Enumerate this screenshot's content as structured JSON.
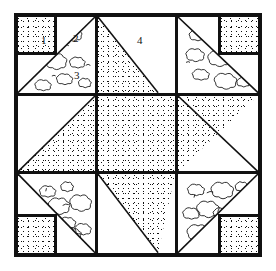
{
  "figure": {
    "kind": "quilt-block-diagram",
    "title": "",
    "background": "#ffffff",
    "line_color": "#111111",
    "frame": {
      "x": 14,
      "y": 13,
      "width": 248,
      "height": 244,
      "border_width": 4
    },
    "grid": {
      "rows": 3,
      "cols": 3,
      "divider_width": 3
    }
  },
  "labels": [
    {
      "id": "1",
      "text": "1",
      "patch": "corner-square-dotted",
      "cell": "top-left",
      "x": 41,
      "y": 35
    },
    {
      "id": "2",
      "text": "2",
      "patch": "white-background",
      "cell": "top-left",
      "x": 73,
      "y": 33
    },
    {
      "id": "3",
      "text": "3",
      "patch": "floral-triangle",
      "cell": "top-left",
      "x": 74,
      "y": 70
    },
    {
      "id": "4",
      "text": "4",
      "patch": "white-background",
      "cell": "top-middle",
      "x": 137,
      "y": 35
    }
  ],
  "fabrics": [
    {
      "name": "dotted",
      "description": "small dark speckles on white"
    },
    {
      "name": "floral",
      "description": "cloud-like flower motifs outlined on white"
    },
    {
      "name": "plain",
      "description": "solid white background"
    }
  ],
  "cells": [
    {
      "position": "top-left",
      "row": 1,
      "col": 1,
      "patches": [
        "dotted-square-top-left",
        "plain",
        "floral-triangle-lower-right"
      ]
    },
    {
      "position": "top-middle",
      "row": 1,
      "col": 2,
      "patches": [
        "dotted-triangle-left",
        "plain"
      ]
    },
    {
      "position": "top-right",
      "row": 1,
      "col": 3,
      "patches": [
        "dotted-square-top-right",
        "plain",
        "floral-triangle-lower-left"
      ]
    },
    {
      "position": "middle-left",
      "row": 2,
      "col": 1,
      "patches": [
        "plain-triangle-upper",
        "dotted-triangle-lower"
      ]
    },
    {
      "position": "center",
      "row": 2,
      "col": 2,
      "patches": [
        "dotted-square-full"
      ]
    },
    {
      "position": "middle-right",
      "row": 2,
      "col": 3,
      "patches": [
        "dotted-triangle-upper",
        "plain-triangle-lower"
      ]
    },
    {
      "position": "bottom-left",
      "row": 3,
      "col": 1,
      "patches": [
        "floral-triangle-upper-right",
        "plain",
        "dotted-square-bottom-left"
      ]
    },
    {
      "position": "bottom-middle",
      "row": 3,
      "col": 2,
      "patches": [
        "dotted-triangle-upper",
        "plain"
      ]
    },
    {
      "position": "bottom-right",
      "row": 3,
      "col": 3,
      "patches": [
        "floral-triangle-upper-left",
        "plain",
        "dotted-square-bottom-right"
      ]
    }
  ]
}
